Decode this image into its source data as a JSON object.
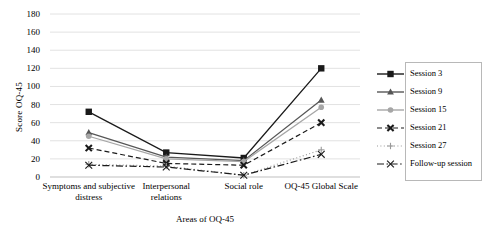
{
  "chart_data": {
    "type": "line",
    "title": "",
    "xlabel": "Areas of OQ-45",
    "ylabel": "Score OQ-45",
    "categories": [
      "Symptoms and subjective distress",
      "Interpersonal relations",
      "Social role",
      "OQ-45 Global Scale"
    ],
    "ylim": [
      0,
      180
    ],
    "yticks": [
      0,
      20,
      40,
      60,
      80,
      100,
      120,
      140,
      160,
      180
    ],
    "grid": true,
    "legend_position": "right",
    "series": [
      {
        "name": "Session 3",
        "values": [
          72,
          27,
          21,
          120
        ],
        "marker": "filled-square",
        "line": "solid",
        "color": "#1a1a1a"
      },
      {
        "name": "Session 9",
        "values": [
          49,
          22,
          18,
          85
        ],
        "marker": "triangle",
        "line": "solid",
        "color": "#565656"
      },
      {
        "name": "Session 15",
        "values": [
          45,
          20,
          17,
          77
        ],
        "marker": "circle",
        "line": "solid",
        "color": "#a6a6a6"
      },
      {
        "name": "Session 21",
        "values": [
          32,
          15,
          13,
          60
        ],
        "marker": "bold-x",
        "line": "dashed",
        "color": "#1a1a1a"
      },
      {
        "name": "Session 27",
        "values": [
          14,
          12,
          2,
          30
        ],
        "marker": "plus",
        "line": "dotted",
        "color": "#9a9a9a"
      },
      {
        "name": "Follow-up session",
        "values": [
          13,
          11,
          2,
          25
        ],
        "marker": "cross",
        "line": "dashdot",
        "color": "#1a1a1a"
      }
    ]
  }
}
